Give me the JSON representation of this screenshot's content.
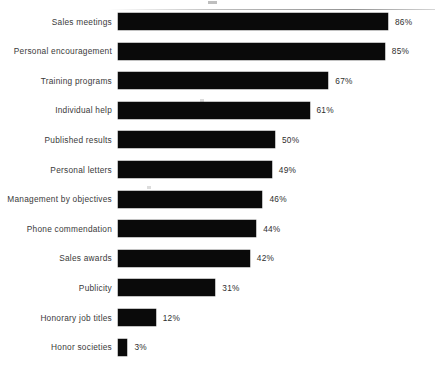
{
  "chart_data": {
    "type": "bar",
    "orientation": "horizontal",
    "title": "",
    "xlabel": "",
    "ylabel": "",
    "xlim": [
      0,
      100
    ],
    "grid": false,
    "legend": null,
    "value_suffix": "%",
    "categories": [
      "Sales meetings",
      "Personal encouragement",
      "Training programs",
      "Individual help",
      "Published results",
      "Personal letters",
      "Management by objectives",
      "Phone commendation",
      "Sales awards",
      "Publicity",
      "Honorary job titles",
      "Honor societies"
    ],
    "values": [
      86,
      85,
      67,
      61,
      50,
      49,
      46,
      44,
      42,
      31,
      12,
      3
    ],
    "value_labels": [
      "86%",
      "85%",
      "67%",
      "61%",
      "50%",
      "49%",
      "46%",
      "44%",
      "42%",
      "31%",
      "12%",
      "3%"
    ],
    "bar_color": "#0a0a0a",
    "background_color": "#ffffff"
  }
}
